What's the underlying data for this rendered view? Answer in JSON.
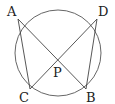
{
  "diagram": {
    "type": "geometry",
    "circle": {
      "cx": 58,
      "cy": 53,
      "r": 43
    },
    "points": {
      "A": {
        "label": "A",
        "x": 18,
        "y": 19
      },
      "D": {
        "label": "D",
        "x": 97,
        "y": 19
      },
      "C": {
        "label": "C",
        "x": 30,
        "y": 89
      },
      "B": {
        "label": "B",
        "x": 86,
        "y": 89
      },
      "P": {
        "label": "P",
        "x": 58,
        "y": 60
      }
    },
    "segments": [
      [
        "A",
        "B"
      ],
      [
        "C",
        "D"
      ],
      [
        "A",
        "C"
      ],
      [
        "D",
        "B"
      ]
    ],
    "stroke_color": "#444444"
  }
}
